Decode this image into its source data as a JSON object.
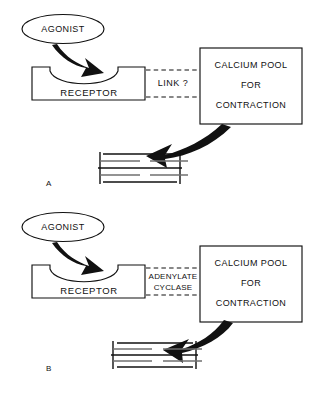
{
  "figure": {
    "caption": ""
  },
  "panels": [
    {
      "id": "A",
      "label": "A",
      "agonist_label": "AGONIST",
      "receptor_label": "RECEPTOR",
      "link_label": "LINK ?",
      "pool_lines": [
        "CALCIUM  POOL",
        "FOR",
        "CONTRACTION"
      ],
      "muscle_state": "relaxed"
    },
    {
      "id": "B",
      "label": "B",
      "agonist_label": "AGONIST",
      "receptor_label": "RECEPTOR",
      "link_label_line1": "ADENYLATE",
      "link_label_line2": "CYCLASE",
      "pool_lines": [
        "CALCIUM  POOL",
        "FOR",
        "CONTRACTION"
      ],
      "muscle_state": "contracted"
    }
  ],
  "icons": {
    "agonist": "ellipse-icon",
    "binding_arrow": "curved-arrow-icon",
    "contraction_arrow": "curved-arrow-icon",
    "muscle": "striated-muscle-icon"
  },
  "colors": {
    "ink": "#111111",
    "muted_line": "#6f6f6f",
    "background": "#ffffff"
  }
}
